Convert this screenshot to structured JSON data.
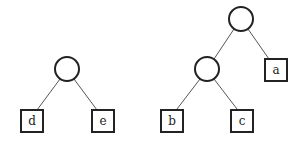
{
  "diagram": {
    "type": "binary-trees",
    "colors": {
      "stroke": "#222222",
      "edge": "#555555",
      "background": "#ffffff"
    },
    "trees": [
      {
        "name": "left-tree",
        "root": {
          "x": 67,
          "y": 69,
          "r": 12
        },
        "leaves": [
          {
            "label": "d",
            "x": 32,
            "y": 121
          },
          {
            "label": "e",
            "x": 103,
            "y": 121
          }
        ]
      },
      {
        "name": "right-tree",
        "root": {
          "x": 241,
          "y": 19,
          "r": 12
        },
        "internal": {
          "x": 207,
          "y": 69,
          "r": 12
        },
        "leaves": [
          {
            "label": "a",
            "x": 276,
            "y": 70
          },
          {
            "label": "b",
            "x": 172,
            "y": 121
          },
          {
            "label": "c",
            "x": 242,
            "y": 121
          }
        ]
      }
    ]
  }
}
